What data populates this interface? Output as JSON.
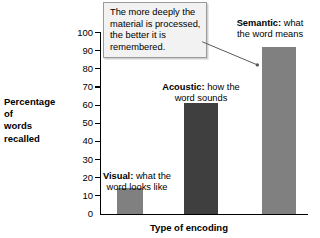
{
  "chart_data": {
    "type": "bar",
    "title": "",
    "categories": [
      "Visual",
      "Acoustic",
      "Semantic"
    ],
    "values": [
      14,
      61,
      92
    ],
    "xlabel": "Type of encoding",
    "ylabel": "Percentage of words recalled",
    "ylim": [
      0,
      100
    ],
    "ytick_step": 10,
    "yticks": [
      "100",
      "90",
      "80",
      "70",
      "60",
      "50",
      "40",
      "30",
      "20",
      "10",
      "0"
    ],
    "grid": false,
    "legend": false,
    "bar_colors": [
      "#808080",
      "#3f3f3f",
      "#808080"
    ],
    "annotations": [
      {
        "target": "Visual",
        "bold": "Visual:",
        "rest": " what the",
        "line2": "word looks like"
      },
      {
        "target": "Acoustic",
        "bold": "Acoustic:",
        "rest": " how the",
        "line2": "word sounds"
      },
      {
        "target": "Semantic",
        "bold": "Semantic:",
        "rest": " what",
        "line2": "the word means"
      }
    ],
    "callout": {
      "text": "The more deeply the material is processed, the better it is remembered.",
      "points_to": "Semantic"
    }
  },
  "axes": {
    "y_label_lines": [
      "Percentage",
      "of",
      "words",
      "recalled"
    ],
    "x_label": "Type of encoding"
  },
  "ticks": {
    "t100": "100",
    "t90": "90",
    "t80": "80",
    "t70": "70",
    "t60": "60",
    "t50": "50",
    "t40": "40",
    "t30": "30",
    "t20": "20",
    "t10": "10",
    "t0": "0"
  },
  "bar_notes": {
    "visual_bold": "Visual:",
    "visual_rest": " what the",
    "visual_line2": "word looks like",
    "acoustic_bold": "Acoustic:",
    "acoustic_rest": " how the",
    "acoustic_line2": "word sounds",
    "semantic_bold": "Semantic:",
    "semantic_rest": " what",
    "semantic_line2": "the word means"
  },
  "callout": {
    "text": "The more deeply the material is processed, the better it is remembered."
  },
  "colors": {
    "bar_light": "#808080",
    "bar_dark": "#3f3f3f",
    "callout_bg": "#f2f2f2",
    "callout_border": "#9a9a9a",
    "axis": "#000000"
  }
}
